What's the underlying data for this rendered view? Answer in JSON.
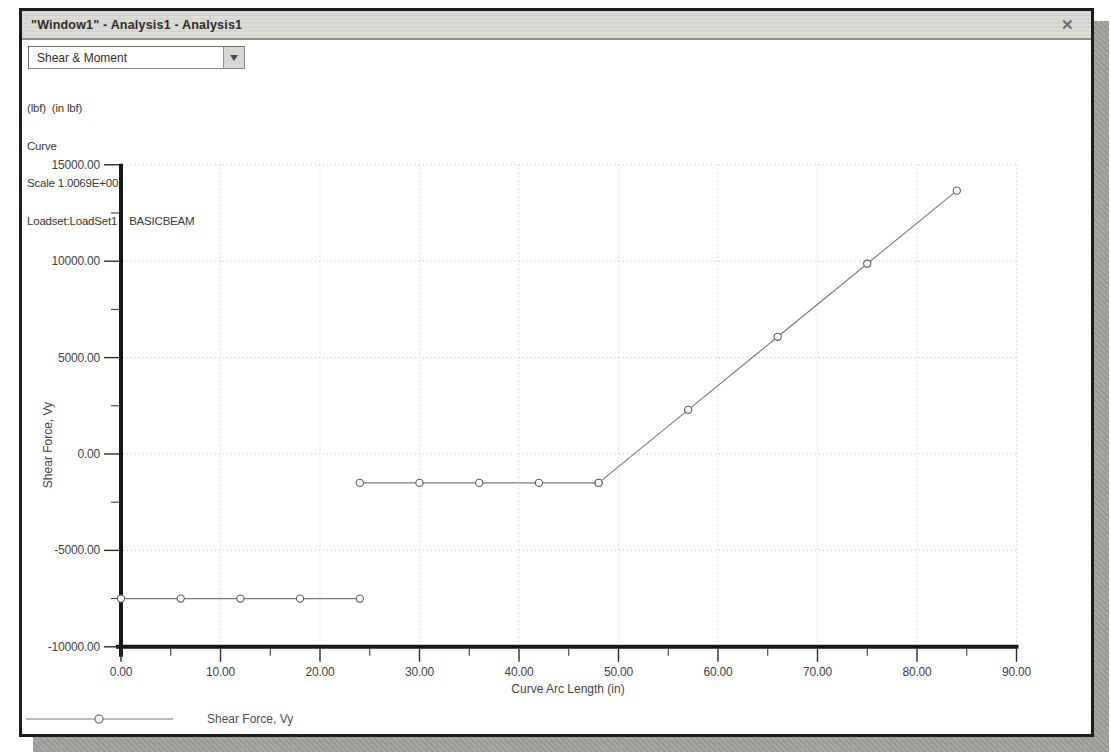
{
  "window": {
    "title": "\"Window1\" - Analysis1 - Analysis1",
    "close_glyph": "✕"
  },
  "toolbar": {
    "result_dropdown": {
      "value": "Shear & Moment"
    }
  },
  "info": {
    "lines": [
      "(lbf)  (in lbf)",
      "Curve",
      "Scale 1.0069E+00",
      "Loadset:LoadSet1 :  BASICBEAM"
    ]
  },
  "chart_data": {
    "type": "line",
    "title": "",
    "xlabel": "Curve Arc Length (in)",
    "ylabel": "Shear Force, Vy",
    "xlim": [
      0,
      90
    ],
    "ylim": [
      -10000,
      15000
    ],
    "x_major_tick": 10,
    "x_minor_tick": 5,
    "y_major_tick": 5000,
    "y_minor_tick": 2500,
    "x_tick_labels": [
      "0.00",
      "10.00",
      "20.00",
      "30.00",
      "40.00",
      "50.00",
      "60.00",
      "70.00",
      "80.00",
      "90.00"
    ],
    "y_tick_labels": [
      "15000.00",
      "10000.00",
      "5000.00",
      "0.00",
      "-5000.00",
      "-10000.00"
    ],
    "grid": {
      "style": "dotted",
      "horizontal_at": [
        15000,
        10000,
        5000,
        0,
        -5000
      ],
      "vertical_at": [
        10,
        20,
        30,
        40,
        50,
        60,
        70,
        80,
        90
      ]
    },
    "legend": [
      {
        "label": "Shear Force, Vy",
        "marker": "open-circle-on-line",
        "position": "bottom-left"
      }
    ],
    "series": [
      {
        "name": "Shear Force, Vy",
        "marker": "open-circle",
        "line_color": "#7b7975",
        "segments": [
          [
            [
              0,
              -7500
            ],
            [
              6,
              -7500
            ],
            [
              12,
              -7500
            ],
            [
              18,
              -7500
            ],
            [
              24,
              -7500
            ]
          ],
          [
            [
              24,
              -1500
            ],
            [
              30,
              -1500
            ],
            [
              36,
              -1500
            ],
            [
              42,
              -1500
            ],
            [
              48,
              -1500
            ]
          ],
          [
            [
              48,
              -1500
            ],
            [
              57,
              2290
            ],
            [
              66,
              6080
            ],
            [
              75,
              9870
            ],
            [
              84,
              13660
            ]
          ]
        ]
      }
    ]
  },
  "colors": {
    "window_border": "#1d1d1b",
    "titlebar_bg": "#dbd9d4",
    "shadow": "#a3a19d",
    "grid": "#c7c5c1",
    "axis": "#161614",
    "series_line": "#7b7975",
    "text": "#45433f"
  }
}
